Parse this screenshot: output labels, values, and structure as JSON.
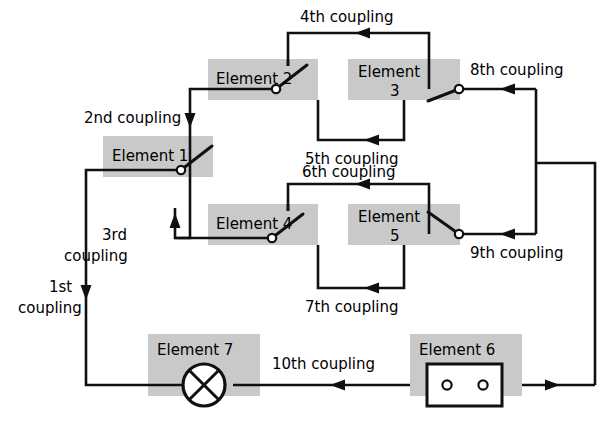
{
  "diagram": {
    "type": "circuit-block-diagram",
    "background_color": "#ffffff",
    "element_box_color": "#c9c9c9",
    "line_color": "#101010"
  },
  "elements": [
    {
      "id": "element-1",
      "label": "Element 1",
      "label_lines": [
        "Element 1"
      ],
      "symbol": "switch",
      "pivot_side": "right"
    },
    {
      "id": "element-2",
      "label": "Element 2",
      "label_lines": [
        "Element 2"
      ],
      "symbol": "switch",
      "pivot_side": "right"
    },
    {
      "id": "element-3",
      "label": "Element 3",
      "label_lines": [
        "Element",
        "3"
      ],
      "symbol": "switch",
      "pivot_side": "right"
    },
    {
      "id": "element-4",
      "label": "Element 4",
      "label_lines": [
        "Element 4"
      ],
      "symbol": "switch",
      "pivot_side": "right"
    },
    {
      "id": "element-5",
      "label": "Element 5",
      "label_lines": [
        "Element",
        "5"
      ],
      "symbol": "switch",
      "pivot_side": "right"
    },
    {
      "id": "element-6",
      "label": "Element 6",
      "label_lines": [
        "Element 6"
      ],
      "symbol": "terminal-block"
    },
    {
      "id": "element-7",
      "label": "Element 7",
      "label_lines": [
        "Element 7"
      ],
      "symbol": "lamp"
    }
  ],
  "couplings": [
    {
      "id": "coupling-1",
      "label": "1st coupling",
      "label_lines": [
        "1st",
        "coupling"
      ],
      "direction": "down"
    },
    {
      "id": "coupling-2",
      "label": "2nd coupling",
      "label_lines": [
        "2nd coupling"
      ],
      "direction": "down"
    },
    {
      "id": "coupling-3",
      "label": "3rd coupling",
      "label_lines": [
        "3rd",
        "coupling"
      ],
      "direction": "up"
    },
    {
      "id": "coupling-4",
      "label": "4th coupling",
      "label_lines": [
        "4th coupling"
      ],
      "direction": "left"
    },
    {
      "id": "coupling-5",
      "label": "5th coupling",
      "label_lines": [
        "5th coupling"
      ],
      "direction": "left"
    },
    {
      "id": "coupling-6",
      "label": "6th coupling",
      "label_lines": [
        "6th coupling"
      ],
      "direction": "left"
    },
    {
      "id": "coupling-7",
      "label": "7th coupling",
      "label_lines": [
        "7th coupling"
      ],
      "direction": "left"
    },
    {
      "id": "coupling-8",
      "label": "8th coupling",
      "label_lines": [
        "8th coupling"
      ],
      "direction": "left"
    },
    {
      "id": "coupling-9",
      "label": "9th coupling",
      "label_lines": [
        "9th coupling"
      ],
      "direction": "left"
    },
    {
      "id": "coupling-10",
      "label": "10th coupling",
      "label_lines": [
        "10th coupling"
      ],
      "direction": "left"
    }
  ]
}
